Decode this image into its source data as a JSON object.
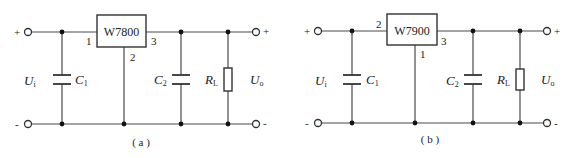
{
  "figure": {
    "circuits": [
      {
        "id": "a",
        "regulator": "W7800",
        "pins": {
          "input": "1",
          "ground": "2",
          "output": "3"
        },
        "input_voltage": {
          "symbol": "U",
          "subscript": "i"
        },
        "output_voltage": {
          "symbol": "U",
          "subscript": "o"
        },
        "input_cap": {
          "symbol": "C",
          "subscript": "1"
        },
        "output_cap": {
          "symbol": "C",
          "subscript": "2"
        },
        "load": {
          "symbol": "R",
          "subscript": "L"
        },
        "terminals": {
          "plus": "+",
          "minus": "-"
        },
        "caption": "( a )"
      },
      {
        "id": "b",
        "regulator": "W7900",
        "pins": {
          "input": "2",
          "ground": "1",
          "output": "3"
        },
        "input_voltage": {
          "symbol": "U",
          "subscript": "i"
        },
        "output_voltage": {
          "symbol": "U",
          "subscript": "o"
        },
        "input_cap": {
          "symbol": "C",
          "subscript": "1"
        },
        "output_cap": {
          "symbol": "C",
          "subscript": "2"
        },
        "load": {
          "symbol": "R",
          "subscript": "L"
        },
        "terminals": {
          "plus": "+",
          "minus": "-"
        },
        "caption": "( b )"
      }
    ]
  }
}
